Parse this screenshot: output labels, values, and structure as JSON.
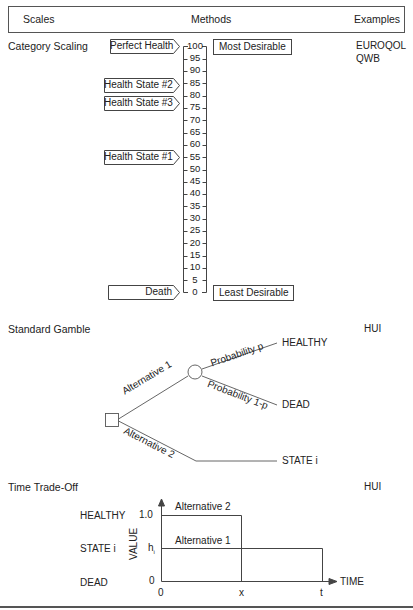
{
  "header": {
    "col_scales": "Scales",
    "col_methods": "Methods",
    "col_examples": "Examples"
  },
  "category_scaling": {
    "title": "Category Scaling",
    "examples": [
      "EUROQOL",
      "QWB"
    ],
    "scale_ticks": [
      "100",
      "95",
      "90",
      "85",
      "80",
      "75",
      "70",
      "65",
      "60",
      "55",
      "50",
      "45",
      "40",
      "35",
      "30",
      "25",
      "20",
      "15",
      "10",
      "5",
      "0"
    ],
    "states": [
      {
        "label": "Perfect Health",
        "value": 100
      },
      {
        "label": "Health State #2",
        "value": 82
      },
      {
        "label": "Health State #3",
        "value": 75
      },
      {
        "label": "Health State #1",
        "value": 55
      },
      {
        "label": "Death",
        "value": 0
      }
    ],
    "top_anchor": "Most Desirable",
    "bottom_anchor": "Least Desirable"
  },
  "standard_gamble": {
    "title": "Standard Gamble",
    "example": "HUI",
    "alt1_label": "Alternative 1",
    "alt2_label": "Alternative 2",
    "prob_p_label": "Probability p",
    "prob_1p_label": "Probability 1-p",
    "outcome_healthy": "HEALTHY",
    "outcome_dead": "DEAD",
    "outcome_state": "STATE i"
  },
  "time_tradeoff": {
    "title": "Time Trade-Off",
    "example": "HUI",
    "row_healthy": "HEALTHY",
    "row_state": "STATE i",
    "row_dead": "DEAD",
    "y_axis_label": "VALUE",
    "x_axis_label": "TIME",
    "y_tick_top": "1.0",
    "y_tick_mid": "h",
    "y_tick_mid_sub": "i",
    "y_tick_bottom": "0",
    "x_tick_0": "0",
    "x_tick_x": "x",
    "x_tick_t": "t",
    "alt2_label": "Alternative 2",
    "alt1_label": "Alternative 1"
  }
}
